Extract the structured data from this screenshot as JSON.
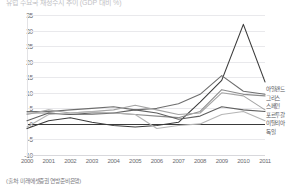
{
  "title": "유럽 주요국 재정수지 추이 (GDP 대비 %)",
  "source": "(출처: 미래에셋증권 연방준비은행)",
  "legend": {
    "position": "right",
    "items": [
      {
        "label": "아일랜드",
        "color": "#3c3c3c"
      },
      {
        "label": "그리스",
        "color": "#6e6e6e"
      },
      {
        "label": "스페인",
        "color": "#8c8c8c"
      },
      {
        "label": "포르투갈",
        "color": "#a5a5a5"
      },
      {
        "label": "이탈리아",
        "color": "#606060"
      },
      {
        "label": "독일",
        "color": "#b5b5b5"
      }
    ]
  },
  "chart_data": {
    "type": "line",
    "title": "유럽 주요국 재정수지 추이 (GDP 대비 %)",
    "xlabel": "",
    "ylabel": "",
    "x": [
      "2000",
      "2001",
      "2002",
      "2003",
      "2004",
      "2005",
      "2006",
      "2007",
      "2008",
      "2009",
      "2010",
      "2011"
    ],
    "ylim": [
      -10,
      35
    ],
    "yticks": [
      35,
      30,
      25,
      20,
      15,
      10,
      5,
      0,
      -5,
      -10
    ],
    "grid": true,
    "series": [
      {
        "name": "아일랜드",
        "color": "#3c3c3c",
        "values": [
          -1.5,
          1.0,
          2.0,
          0.5,
          -0.5,
          -1.0,
          -0.5,
          0.5,
          7.0,
          14.0,
          32.0,
          13.5
        ]
      },
      {
        "name": "그리스",
        "color": "#6e6e6e",
        "values": [
          4.0,
          4.0,
          4.5,
          5.0,
          5.5,
          4.5,
          5.0,
          6.5,
          9.5,
          15.5,
          10.5,
          9.5
        ]
      },
      {
        "name": "스페인",
        "color": "#8c8c8c",
        "values": [
          3.5,
          3.5,
          3.0,
          3.0,
          3.5,
          3.0,
          2.5,
          2.0,
          4.0,
          11.0,
          9.5,
          9.0
        ]
      },
      {
        "name": "포르투갈",
        "color": "#a5a5a5",
        "values": [
          3.0,
          4.5,
          3.5,
          4.0,
          4.5,
          6.0,
          4.5,
          3.0,
          3.5,
          10.0,
          9.0,
          4.5
        ]
      },
      {
        "name": "이탈리아",
        "color": "#606060",
        "values": [
          1.0,
          3.5,
          3.0,
          3.5,
          3.5,
          4.5,
          3.5,
          1.5,
          2.5,
          5.5,
          4.5,
          4.0
        ]
      },
      {
        "name": "독일",
        "color": "#b5b5b5",
        "values": [
          -1.0,
          3.0,
          3.5,
          4.0,
          3.5,
          3.0,
          -1.5,
          -0.5,
          0.0,
          3.0,
          4.0,
          1.0
        ]
      }
    ]
  }
}
